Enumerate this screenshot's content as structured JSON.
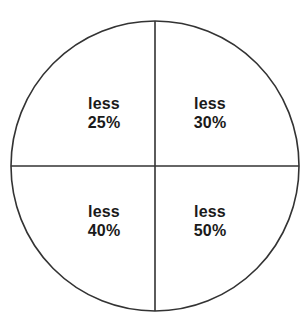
{
  "diagram": {
    "type": "quadrant-circle",
    "title": "",
    "shape": {
      "circle": {
        "center_x": 155,
        "center_y": 166,
        "radius_x": 144,
        "radius_y": 145,
        "stroke_color": "#333333",
        "stroke_width": 1.6,
        "fill_color": "#ffffff"
      },
      "vertical_divider": {
        "x": 155,
        "y_start": 21,
        "y_end": 311,
        "stroke_color": "#333333",
        "stroke_width": 1.6
      },
      "horizontal_divider": {
        "y": 166,
        "x_start": 11,
        "x_end": 299,
        "stroke_color": "#333333",
        "stroke_width": 1.6
      }
    },
    "quadrants": [
      {
        "position": "top-left",
        "word": "less",
        "value": "25%"
      },
      {
        "position": "top-right",
        "word": "less",
        "value": "30%"
      },
      {
        "position": "bottom-left",
        "word": "less",
        "value": "40%"
      },
      {
        "position": "bottom-right",
        "word": "less",
        "value": "50%"
      }
    ]
  },
  "colors": {
    "background": "#ffffff",
    "line": "#333333",
    "text": "#1a1a1a"
  }
}
